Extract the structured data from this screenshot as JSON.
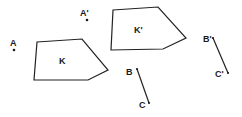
{
  "diagram": {
    "type": "geometric-translation",
    "polygons": [
      {
        "label": "K",
        "points": [
          [
            37,
            42
          ],
          [
            82,
            39
          ],
          [
            108,
            70
          ],
          [
            88,
            80
          ],
          [
            34,
            80
          ]
        ],
        "label_pos": [
          59,
          64
        ]
      },
      {
        "label": "K'",
        "points": [
          [
            113,
            10
          ],
          [
            158,
            7
          ],
          [
            186,
            38
          ],
          [
            163,
            49
          ],
          [
            111,
            50
          ]
        ],
        "label_pos": [
          134,
          33
        ]
      }
    ],
    "points": [
      {
        "label": "A",
        "pos": [
          14,
          50
        ],
        "label_pos": [
          10,
          46
        ]
      },
      {
        "label": "A'",
        "pos": [
          87,
          20
        ],
        "label_pos": [
          80,
          16
        ]
      }
    ],
    "segments": [
      {
        "from_label": "B",
        "to_label": "C",
        "from": [
          137,
          69
        ],
        "to": [
          149,
          103
        ],
        "from_label_pos": [
          126,
          75
        ],
        "to_label_pos": [
          139,
          108
        ]
      },
      {
        "from_label": "B'",
        "to_label": "C'",
        "from": [
          213,
          38
        ],
        "to": [
          228,
          73
        ],
        "from_label_pos": [
          203,
          42
        ],
        "to_label_pos": [
          215,
          77
        ]
      }
    ],
    "colors": {
      "stroke": "#222222",
      "background": "#ffffff"
    }
  }
}
